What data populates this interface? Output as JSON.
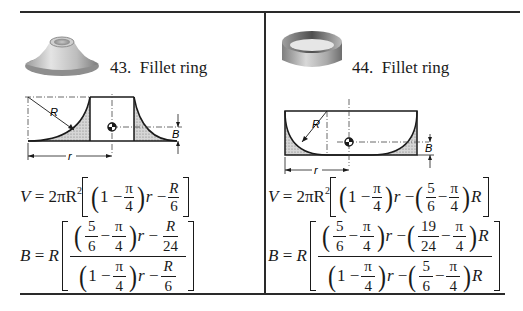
{
  "items": [
    {
      "number": "43.",
      "title": "Fillet ring",
      "photo": "fillet-ring-convex-photo",
      "diagram_labels": {
        "radius": "R",
        "length": "r",
        "centroid_offset": "B"
      },
      "volume_formula": "V = 2πR²[(1 − π/4) r − R/6]",
      "centroid_formula": "B = R[((5/6 − π/4) r − R/24) / ((1 − π/4) r − R/6)]",
      "eq": {
        "V": "V",
        "eq": "=",
        "coef": "2πR",
        "sq": "2",
        "one": "1",
        "minus": "−",
        "pi": "π",
        "four": "4",
        "r": "r",
        "R": "R",
        "six": "6",
        "five": "5",
        "twentyfour": "24",
        "B": "B"
      }
    },
    {
      "number": "44.",
      "title": "Fillet ring",
      "photo": "fillet-ring-concave-photo",
      "diagram_labels": {
        "radius": "R",
        "length": "r",
        "centroid_offset": "B"
      },
      "volume_formula": "V = 2πR²[(1 − π/4) r − (5/6 − π/4) R]",
      "centroid_formula": "B = R[((5/6 − π/4) r − (19/24 − π/4) R) / ((1 − π/4) r − (5/6 − π/4) R)]",
      "eq": {
        "V": "V",
        "eq": "=",
        "coef": "2πR",
        "sq": "2",
        "one": "1",
        "minus": "−",
        "pi": "π",
        "four": "4",
        "r": "r",
        "R": "R",
        "six": "6",
        "five": "5",
        "nineteen": "19",
        "twentyfour": "24",
        "B": "B"
      }
    }
  ]
}
